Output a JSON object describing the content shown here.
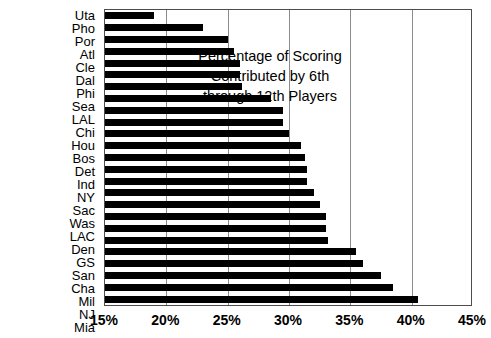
{
  "chart_data": {
    "type": "bar",
    "orientation": "horizontal",
    "title_lines": [
      "Percentage of Scoring",
      "Contributed by 6th",
      "through 12th Players"
    ],
    "xlabel": "",
    "ylabel": "",
    "xlim": [
      15,
      45
    ],
    "xticks": [
      15,
      20,
      25,
      30,
      35,
      40,
      45
    ],
    "xtick_labels": [
      "15%",
      "20%",
      "25%",
      "30%",
      "35%",
      "40%",
      "45%"
    ],
    "grid": true,
    "grid_axis": "x",
    "legend": "none",
    "bar_color": "#000000",
    "plot_border_color": "#4d4d4d",
    "gridline_color": "#8c8c8c",
    "categories": [
      "Uta",
      "Pho",
      "Por",
      "Atl",
      "Cle",
      "Dal",
      "Phi",
      "Sea",
      "LAL",
      "Chi",
      "Hou",
      "Bos",
      "Det",
      "Ind",
      "NY",
      "Sac",
      "Was",
      "LAC",
      "Den",
      "GS",
      "San",
      "Cha",
      "Mil",
      "NJ",
      "Mia"
    ],
    "values": [
      19.0,
      23.0,
      25.0,
      25.5,
      26.0,
      26.0,
      26.2,
      28.5,
      29.5,
      29.5,
      30.0,
      31.0,
      31.3,
      31.5,
      31.5,
      32.0,
      32.5,
      33.0,
      33.0,
      33.2,
      35.5,
      36.0,
      37.5,
      38.5,
      40.5
    ]
  }
}
